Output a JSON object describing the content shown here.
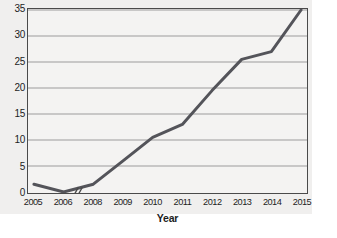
{
  "chart_data": {
    "type": "line",
    "title": "",
    "xlabel": "Year",
    "ylabel": "Percent",
    "x": [
      2005,
      2006,
      2008,
      2009,
      2010,
      2011,
      2012,
      2013,
      2014,
      2015
    ],
    "x_tick_labels": [
      "2005",
      "2006",
      "2008",
      "2009",
      "2010",
      "2011",
      "2012",
      "2013",
      "2014",
      "2015"
    ],
    "values": [
      1.5,
      0.0,
      1.5,
      6.0,
      10.5,
      13.0,
      19.5,
      25.5,
      27.0,
      35.0
    ],
    "series": [
      {
        "name": "Percent",
        "values": [
          1.5,
          0.0,
          1.5,
          6.0,
          10.5,
          13.0,
          19.5,
          25.5,
          27.0,
          35.0
        ]
      }
    ],
    "ylim": [
      0,
      35
    ],
    "xlim": [
      2005,
      2015
    ],
    "y_ticks": [
      0,
      5,
      10,
      15,
      20,
      25,
      30,
      35
    ],
    "y_tick_labels": [
      "0",
      "5",
      "10",
      "15",
      "20",
      "25",
      "30",
      "35"
    ],
    "grid": "horizontal",
    "legend": "none",
    "axis_break": {
      "axis": "x",
      "between": [
        "2006",
        "2008"
      ],
      "skipped_label": "2007",
      "marker": "double-slash"
    },
    "markers": "none",
    "line_color": "#54545a",
    "line_width": 3,
    "grid_color": "#9b9b9b",
    "frame_color": "#4a4a4a",
    "panel_color": "#f0efee",
    "plot_background": "#f4f3f2",
    "text_color": "#1d1d1d"
  }
}
